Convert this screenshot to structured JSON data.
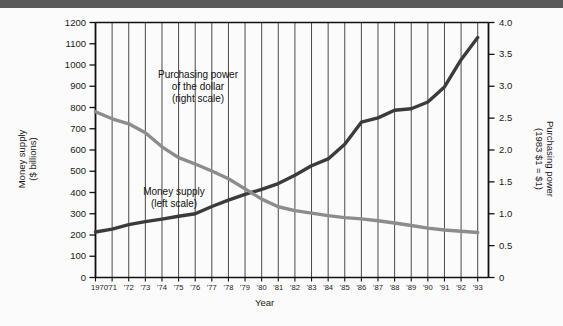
{
  "chart_data": {
    "type": "line",
    "title": "",
    "xlabel": "Year",
    "grid": "vertical-only",
    "legend_position": "inline-annotations",
    "x": [
      1970,
      1971,
      1972,
      1973,
      1974,
      1975,
      1976,
      1977,
      1978,
      1979,
      1980,
      1981,
      1982,
      1983,
      1984,
      1985,
      1986,
      1987,
      1988,
      1989,
      1990,
      1991,
      1992,
      1993
    ],
    "xtick_labels": [
      "1970",
      "'71",
      "'72",
      "'73",
      "'74",
      "'75",
      "'76",
      "'77",
      "'78",
      "'79",
      "'80",
      "'81",
      "'82",
      "'83",
      "'84",
      "'85",
      "'86",
      "'87",
      "'88",
      "'89",
      "'90",
      "'91",
      "'92",
      "'93"
    ],
    "left_axis": {
      "label": "Money supply",
      "sublabel": "($ billions)",
      "ylim": [
        0,
        1200
      ],
      "ticks": [
        0,
        100,
        200,
        300,
        400,
        500,
        600,
        700,
        800,
        900,
        1000,
        1100,
        1200
      ],
      "tick_labels": [
        "0",
        "100",
        "200",
        "300",
        "400",
        "500",
        "600",
        "700",
        "800",
        "900",
        "1000",
        "1100",
        "1200"
      ]
    },
    "right_axis": {
      "label": "Purchasing power",
      "sublabel": "(1983 $1 = $1)",
      "ylim": [
        0,
        4.0
      ],
      "ticks": [
        0,
        0.5,
        1.0,
        1.5,
        2.0,
        2.5,
        3.0,
        3.5,
        4.0
      ],
      "tick_labels": [
        "0",
        "0.5",
        "1.0",
        "1.5",
        "2.0",
        "2.5",
        "3.0",
        "3.5",
        "4.0"
      ]
    },
    "series": [
      {
        "name": "Money supply (left scale)",
        "axis": "left",
        "color": "#3b3b3b",
        "annotation": "Money supply",
        "annotation_sub": "(left scale)",
        "values": [
          214,
          228,
          249,
          263,
          275,
          288,
          300,
          334,
          364,
          391,
          415,
          442,
          481,
          526,
          558,
          627,
          731,
          751,
          787,
          794,
          826,
          897,
          1025,
          1129
        ]
      },
      {
        "name": "Purchasing power of the dollar (right scale)",
        "axis": "right",
        "color": "#8c8c8c",
        "annotation": "Purchasing power",
        "annotation_sub": "of the dollar",
        "annotation_sub2": "(right scale)",
        "values": [
          2.6,
          2.49,
          2.41,
          2.27,
          2.05,
          1.88,
          1.78,
          1.67,
          1.55,
          1.39,
          1.23,
          1.11,
          1.05,
          1.01,
          0.97,
          0.94,
          0.92,
          0.89,
          0.855,
          0.815,
          0.775,
          0.745,
          0.725,
          0.705
        ]
      }
    ]
  },
  "labels": {
    "x_axis_title": "Year",
    "left_axis_title": "Money supply\n($ billions)",
    "right_axis_title": "Purchasing power\n(1983 $1 = $1)"
  }
}
